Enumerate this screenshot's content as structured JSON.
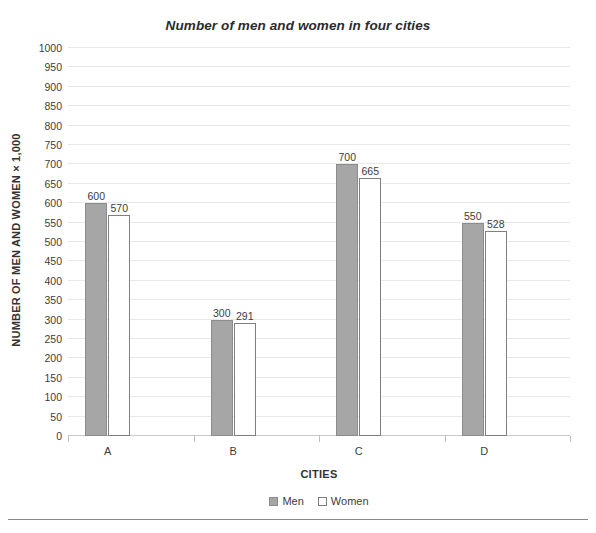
{
  "chart_data": {
    "type": "bar",
    "title": "Number of men and women in four cities",
    "xlabel": "CITIES",
    "ylabel": "NUMBER OF MEN AND WOMEN × 1,000",
    "categories": [
      "A",
      "B",
      "C",
      "D"
    ],
    "series": [
      {
        "name": "Men",
        "values": [
          600,
          300,
          700,
          550
        ],
        "color": "#a6a6a6",
        "border": "#8c8c8c"
      },
      {
        "name": "Women",
        "values": [
          570,
          291,
          665,
          528
        ],
        "color": "#ffffff",
        "border": "#7f7f7f"
      }
    ],
    "ylim": [
      0,
      1000
    ],
    "ytick_step": 50,
    "yticks": [
      0,
      50,
      100,
      150,
      200,
      250,
      300,
      350,
      400,
      450,
      500,
      550,
      600,
      650,
      700,
      750,
      800,
      850,
      900,
      950,
      1000
    ],
    "ytick_labels": [
      "0",
      "50",
      "100",
      "150",
      "200",
      "250",
      "300",
      "350",
      "400",
      "450",
      "500",
      "550",
      "600",
      "650",
      "700",
      "750",
      "800",
      "850",
      "900",
      "950",
      "1000"
    ],
    "grid": true,
    "grid_axis": "y",
    "grid_color": "#e8e8e8",
    "legend": [
      "Men",
      "Women"
    ],
    "legend_position": "bottom-center",
    "data_labels": true,
    "data_label_values": {
      "Men": [
        "600",
        "300",
        "700",
        "550"
      ],
      "Women": [
        "570",
        "291",
        "665",
        "528"
      ]
    }
  },
  "legend": {
    "men_label": "Men",
    "women_label": "Women"
  }
}
